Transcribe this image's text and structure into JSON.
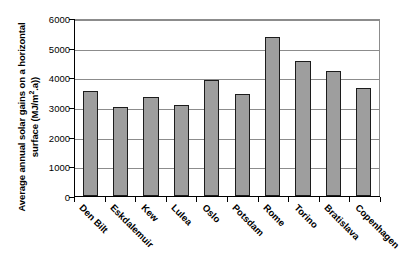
{
  "chart_data": {
    "type": "bar",
    "title": "",
    "xlabel": "",
    "ylabel": "Average annual solar gains on a horizontal surface (MJ/m2.a))",
    "ylabel_line1": "Average annual solar gains on a horizontal",
    "ylabel_line2_pre": "surface (MJ/m",
    "ylabel_line2_sup": "2",
    "ylabel_line2_post": ".a))",
    "categories": [
      "Den Bilt",
      "Eskdalemuir",
      "Kew",
      "Lulea",
      "Oslo",
      "Potsdam",
      "Rome",
      "Torino",
      "Bratislava",
      "Copenhagen"
    ],
    "values": [
      3530,
      2990,
      3350,
      3060,
      3900,
      3450,
      5350,
      4540,
      4200,
      3630
    ],
    "ylim": [
      0,
      6000
    ],
    "y_ticks": [
      0,
      1000,
      2000,
      3000,
      4000,
      5000,
      6000
    ],
    "y_tick_labels": [
      "0",
      "1000",
      "2000",
      "3000",
      "4000",
      "5000",
      "6000"
    ],
    "grid": true,
    "legend": false,
    "bar_color": "#9e9e9e",
    "bar_border_color": "#1c1c1c",
    "grid_color": "#8c8c8c",
    "axis_color": "#000000",
    "background": "#ffffff"
  }
}
